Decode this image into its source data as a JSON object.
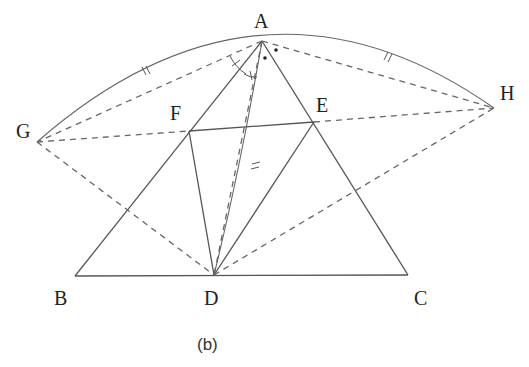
{
  "figure": {
    "caption": "(b)",
    "points": {
      "A": {
        "label": "A",
        "x": 262,
        "y": 41
      },
      "B": {
        "label": "B",
        "x": 75,
        "y": 276
      },
      "C": {
        "label": "C",
        "x": 408,
        "y": 275
      },
      "D": {
        "label": "D",
        "x": 214,
        "y": 275
      },
      "E": {
        "label": "E",
        "x": 314,
        "y": 122
      },
      "F": {
        "label": "F",
        "x": 189,
        "y": 131
      },
      "G": {
        "label": "G",
        "x": 37,
        "y": 142
      },
      "H": {
        "label": "H",
        "x": 494,
        "y": 108
      }
    },
    "solid_segments": [
      "AB",
      "AC",
      "BC",
      "FE",
      "FD",
      "ED"
    ],
    "dashed_segments": [
      "AG",
      "AH",
      "GF",
      "EH",
      "GD",
      "DH",
      "AD"
    ],
    "arcs": [
      "GA",
      "AH",
      "AD"
    ],
    "equal_marks": [
      "arc GA",
      "arc AH",
      "arc AD"
    ],
    "angle_marks": "equal angles at A (single arc ticks), dots marking angles at A"
  }
}
